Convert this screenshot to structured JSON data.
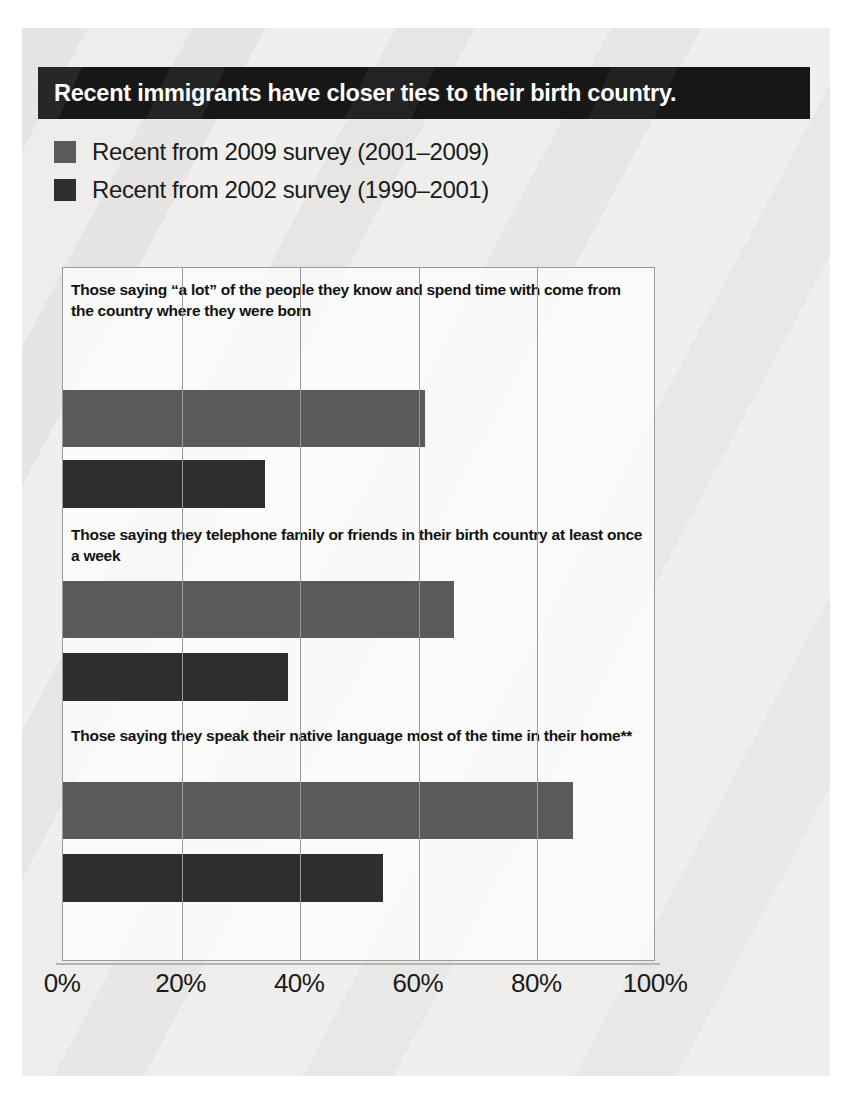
{
  "title": "Recent immigrants have closer ties to their birth country.",
  "legend": [
    {
      "label": "Recent from 2009 survey (2001–2009)",
      "color": "#5a5a5a",
      "swatch_name": "legend-swatch-2009"
    },
    {
      "label": "Recent from 2002 survey (1990–2001)",
      "color": "#2e2e2e",
      "swatch_name": "legend-swatch-2002"
    }
  ],
  "chart_data": {
    "type": "bar",
    "orientation": "horizontal",
    "title": "Recent immigrants have closer ties to their birth country.",
    "xlabel": "",
    "ylabel": "",
    "xlim": [
      0,
      100
    ],
    "xticks": [
      "0%",
      "20%",
      "40%",
      "60%",
      "80%",
      "100%"
    ],
    "xtick_values": [
      0,
      20,
      40,
      60,
      80,
      100
    ],
    "grid": true,
    "legend_position": "above-plot",
    "categories": [
      "Those saying “a lot” of the people they know and spend time with come from the country where they were born",
      "Those saying they telephone family or friends in their birth country at least once a week",
      "Those saying they speak their native language most of the time in their home**"
    ],
    "series": [
      {
        "name": "Recent from 2009 survey (2001–2009)",
        "color": "#5a5a5a",
        "values": [
          61,
          66,
          86
        ]
      },
      {
        "name": "Recent from 2002 survey (1990–2001)",
        "color": "#2e2e2e",
        "values": [
          34,
          38,
          54
        ]
      }
    ]
  }
}
